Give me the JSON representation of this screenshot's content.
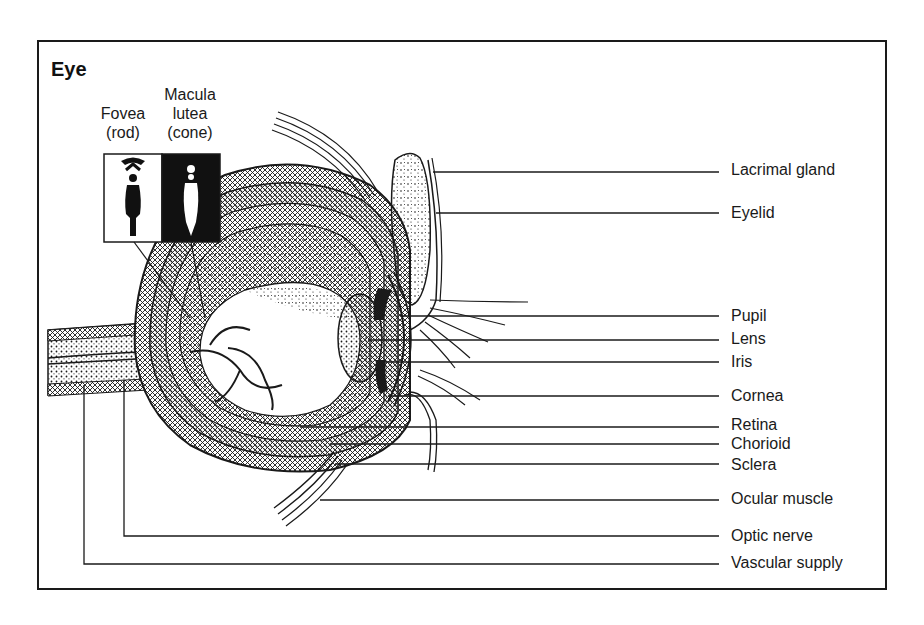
{
  "title": "Eye",
  "inset": {
    "fovea_caption": [
      "Fovea",
      "(rod)"
    ],
    "macula_caption": [
      "Macula",
      "lutea",
      "(cone)"
    ]
  },
  "labels": [
    {
      "text": "Lacrimal gland",
      "y": 170
    },
    {
      "text": "Eyelid",
      "y": 213
    },
    {
      "text": "Pupil",
      "y": 316
    },
    {
      "text": "Lens",
      "y": 339
    },
    {
      "text": "Iris",
      "y": 362
    },
    {
      "text": "Cornea",
      "y": 396
    },
    {
      "text": "Retina",
      "y": 427
    },
    {
      "text": "Chorioid",
      "y": 444
    },
    {
      "text": "Sclera",
      "y": 465
    },
    {
      "text": "Ocular muscle",
      "y": 499
    },
    {
      "text": "Optic nerve",
      "y": 536
    },
    {
      "text": "Vascular supply",
      "y": 563
    }
  ],
  "colors": {
    "ink": "#1a1a1a",
    "background": "#ffffff"
  }
}
